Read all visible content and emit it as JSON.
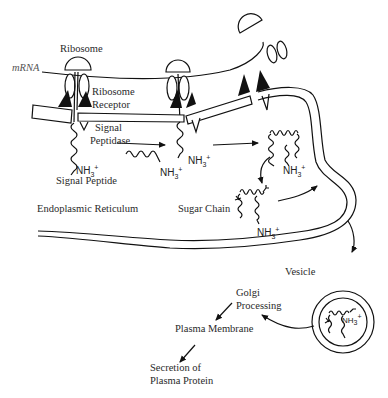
{
  "diagram": {
    "type": "biological-process"
  },
  "labels": {
    "ribosome": "Ribosome",
    "mrna": "mRNA",
    "ribosome_receptor_line1": "Ribosome",
    "ribosome_receptor_line2": "Receptor",
    "signal_peptidase_line1": "Signal",
    "signal_peptidase_line2": "Peptidase",
    "signal_peptide": "Signal Peptide",
    "endoplasmic_reticulum": "Endoplasmic Reticulum",
    "sugar_chain": "Sugar Chain",
    "vesicle": "Vesicle",
    "golgi_line1": "Golgi",
    "golgi_line2": "Processing",
    "plasma_membrane": "Plasma Membrane",
    "secretion_line1": "Secretion of",
    "secretion_line2": "Plasma Protein"
  },
  "chem": {
    "nh3_base": "NH",
    "nh3_sub": "3",
    "nh3_sup": "+"
  },
  "flow_steps": [
    "Ribosome binds ribosome receptor on ER",
    "Signal peptide cleaved by signal peptidase",
    "Protein folds in ER lumen",
    "Sugar chain added",
    "Vesicle transport",
    "Golgi Processing",
    "Plasma Membrane",
    "Secretion of Plasma Protein"
  ]
}
